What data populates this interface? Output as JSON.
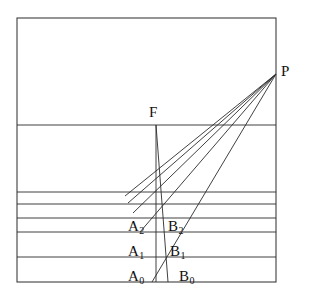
{
  "figure": {
    "background_color": "#ffffff",
    "line_color": "#2b2b2b",
    "label_color": "#111111",
    "frame": {
      "x": 17,
      "y": 18,
      "width": 259,
      "height": 264
    },
    "horizontal_lines": [
      {
        "name": "line-upper",
        "y": 125
      },
      {
        "name": "line-h2",
        "y": 192
      },
      {
        "name": "line-h3",
        "y": 204
      },
      {
        "name": "line-h4",
        "y": 218
      },
      {
        "name": "line-h5",
        "y": 232
      },
      {
        "name": "line-h6",
        "y": 257
      }
    ],
    "vertex_p": {
      "x": 276,
      "y": 74
    },
    "vertex_f": {
      "x": 156,
      "y": 125
    },
    "f_line_bottom": {
      "x": 168,
      "y": 282
    },
    "fan_targets": [
      {
        "x": 152,
        "y": 282
      },
      {
        "x": 140,
        "y": 232
      },
      {
        "x": 133,
        "y": 213
      },
      {
        "x": 128,
        "y": 203
      },
      {
        "x": 125,
        "y": 196
      }
    ],
    "labels": [
      {
        "name": "label-p",
        "text": "P",
        "sub": "",
        "x": 281,
        "y": 76
      },
      {
        "name": "label-f",
        "text": "F",
        "sub": "",
        "x": 149,
        "y": 117
      },
      {
        "name": "label-a2",
        "text": "A",
        "sub": "2",
        "x": 128,
        "y": 231
      },
      {
        "name": "label-b2",
        "text": "B",
        "sub": "2",
        "x": 168,
        "y": 231
      },
      {
        "name": "label-a1",
        "text": "A",
        "sub": "1",
        "x": 128,
        "y": 256
      },
      {
        "name": "label-b1",
        "text": "B",
        "sub": "1",
        "x": 170,
        "y": 256
      },
      {
        "name": "label-a0",
        "text": "A",
        "sub": "0",
        "x": 128,
        "y": 281
      },
      {
        "name": "label-b0",
        "text": "B",
        "sub": "0",
        "x": 179,
        "y": 281
      }
    ]
  }
}
